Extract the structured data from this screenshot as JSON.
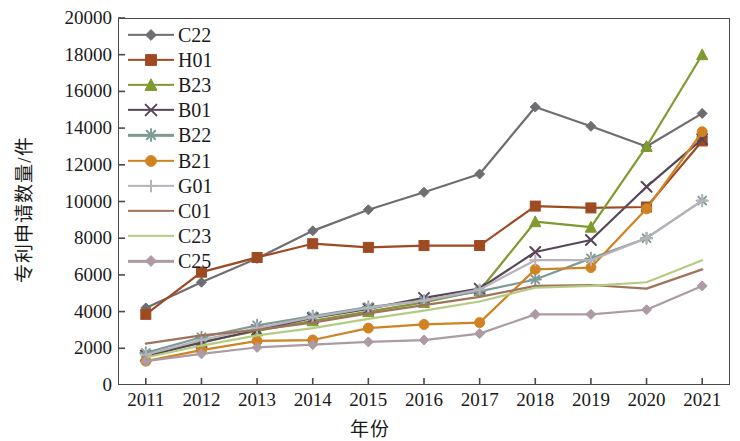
{
  "chart_data": {
    "type": "line",
    "title": "",
    "xlabel": "年份",
    "ylabel": "专利申请数量/件",
    "categories": [
      "2011",
      "2012",
      "2013",
      "2014",
      "2015",
      "2016",
      "2017",
      "2018",
      "2019",
      "2020",
      "2021"
    ],
    "x_tick_labels": [
      "2011",
      "2012",
      "2013",
      "2014",
      "2015",
      "2016",
      "2017",
      "2018",
      "2019",
      "2020",
      "2021"
    ],
    "y_tick_labels": [
      "0",
      "2000",
      "4000",
      "6000",
      "8000",
      "10000",
      "12000",
      "14000",
      "16000",
      "18000",
      "20000"
    ],
    "y_ticks": [
      0,
      2000,
      4000,
      6000,
      8000,
      10000,
      12000,
      14000,
      16000,
      18000,
      20000
    ],
    "ylim": [
      0,
      20000
    ],
    "grid": false,
    "legend_position": "top-left",
    "series": [
      {
        "name": "C22",
        "color": "#6e6e72",
        "marker": "diamond",
        "values": [
          4200,
          5600,
          6900,
          8400,
          9550,
          10500,
          11500,
          15150,
          14100,
          13000,
          14800
        ]
      },
      {
        "name": "H01",
        "color": "#9e4a22",
        "marker": "square",
        "values": [
          3850,
          6150,
          6950,
          7700,
          7500,
          7600,
          7600,
          9750,
          9650,
          9700,
          13300
        ]
      },
      {
        "name": "B23",
        "color": "#7f9a2e",
        "marker": "triangle",
        "values": [
          1550,
          2350,
          2950,
          3500,
          4000,
          4500,
          5150,
          8900,
          8600,
          13000,
          18000
        ]
      },
      {
        "name": "B01",
        "color": "#584658",
        "marker": "x",
        "values": [
          1600,
          2300,
          3000,
          3650,
          4150,
          4750,
          5250,
          7250,
          7900,
          10800,
          13400
        ]
      },
      {
        "name": "B22",
        "color": "#7d9b95",
        "marker": "star",
        "values": [
          1750,
          2600,
          3250,
          3750,
          4250,
          4600,
          5100,
          5750,
          6900,
          8000,
          10050
        ]
      },
      {
        "name": "B21",
        "color": "#cf8322",
        "marker": "circle",
        "values": [
          1300,
          1900,
          2400,
          2450,
          3100,
          3300,
          3400,
          6300,
          6400,
          9600,
          13800
        ]
      },
      {
        "name": "G01",
        "color": "#b8b2bd",
        "marker": "plus",
        "values": [
          1650,
          2450,
          3100,
          3700,
          4200,
          4600,
          5200,
          6800,
          6800,
          8000,
          10050
        ]
      },
      {
        "name": "C01",
        "color": "#a0735c",
        "marker": "none",
        "values": [
          2250,
          2700,
          3000,
          3400,
          3900,
          4350,
          4800,
          5400,
          5450,
          5250,
          6300
        ]
      },
      {
        "name": "C23",
        "color": "#b4cc80",
        "marker": "none",
        "values": [
          1500,
          2150,
          2700,
          3100,
          3600,
          4050,
          4550,
          5300,
          5400,
          5600,
          6800
        ]
      },
      {
        "name": "C25",
        "color": "#ac9ba5",
        "marker": "diamond",
        "values": [
          1300,
          1700,
          2050,
          2200,
          2350,
          2450,
          2800,
          3850,
          3850,
          4100,
          5400
        ]
      }
    ]
  },
  "legend": {
    "items": [
      {
        "label": "C22"
      },
      {
        "label": "H01"
      },
      {
        "label": "B23"
      },
      {
        "label": "B01"
      },
      {
        "label": "B22"
      },
      {
        "label": "B21"
      },
      {
        "label": "G01"
      },
      {
        "label": "C01"
      },
      {
        "label": "C23"
      },
      {
        "label": "C25"
      }
    ]
  }
}
